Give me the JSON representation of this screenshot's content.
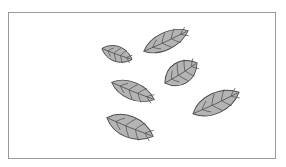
{
  "diagram": {
    "type": "scattered-leaves-illustration",
    "leaf_count": 6,
    "colors": {
      "frame_border": "#9a9a9a",
      "leaf_fill": "#b4b4b4",
      "leaf_stroke": "#4a4a4a",
      "vein_stroke": "#555555"
    },
    "leaves": [
      {
        "id": "leaf-1",
        "cx": 117,
        "cy": 54,
        "length": 32,
        "width": 15,
        "angle": 20
      },
      {
        "id": "leaf-2",
        "cx": 166,
        "cy": 41,
        "length": 49,
        "width": 17,
        "angle": -25
      },
      {
        "id": "leaf-3",
        "cx": 181,
        "cy": 73,
        "length": 38,
        "width": 22,
        "angle": -32
      },
      {
        "id": "leaf-4",
        "cx": 133,
        "cy": 91,
        "length": 46,
        "width": 17,
        "angle": 22
      },
      {
        "id": "leaf-5",
        "cx": 216,
        "cy": 103,
        "length": 51,
        "width": 20,
        "angle": -25
      },
      {
        "id": "leaf-6",
        "cx": 130,
        "cy": 127,
        "length": 50,
        "width": 21,
        "angle": 22
      }
    ]
  }
}
